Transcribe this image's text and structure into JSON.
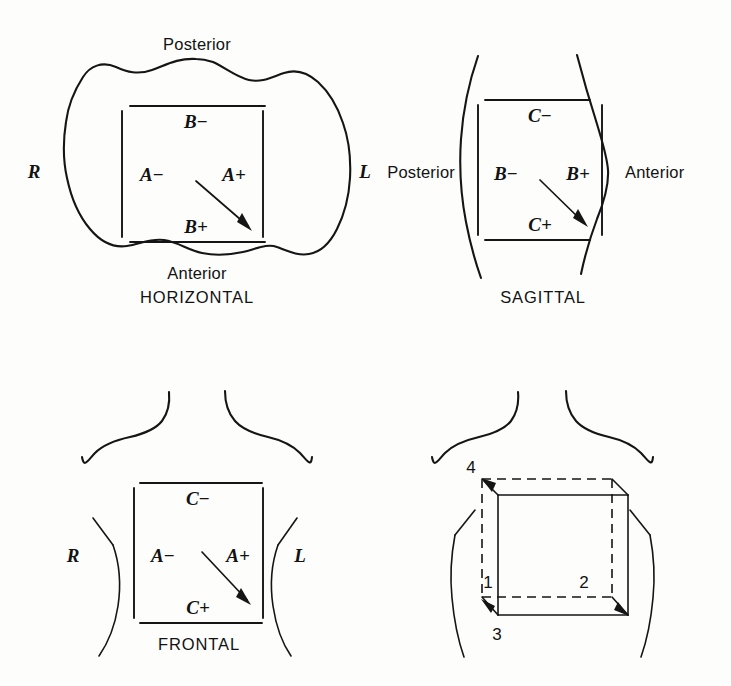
{
  "figure": {
    "background_color": "#fdfdfc",
    "ink_color": "#151515",
    "panels": [
      {
        "id": "horizontal",
        "caption": "HORIZONTAL",
        "orientation_labels": {
          "top": "Posterior",
          "bottom": "Anterior",
          "left": "R",
          "right": "L"
        },
        "axis_labels": {
          "top_inner": "B−",
          "bottom_inner": "B+",
          "left_inner": "A−",
          "right_inner": "A+"
        },
        "arrow": "diagonal-down-right"
      },
      {
        "id": "sagittal",
        "caption": "SAGITTAL",
        "orientation_labels": {
          "left": "Posterior",
          "right": "Anterior"
        },
        "axis_labels": {
          "top_inner": "C−",
          "bottom_inner": "C+",
          "left_inner": "B−",
          "right_inner": "B+"
        },
        "arrow": "diagonal-down-right"
      },
      {
        "id": "frontal",
        "caption": "FRONTAL",
        "orientation_labels": {
          "left": "R",
          "right": "L"
        },
        "axis_labels": {
          "top_inner": "C−",
          "bottom_inner": "C+",
          "left_inner": "A−",
          "right_inner": "A+"
        },
        "arrow": "diagonal-down-right"
      },
      {
        "id": "cube",
        "caption": "",
        "corner_labels": [
          "1",
          "2",
          "3",
          "4"
        ],
        "line_styles": [
          "solid",
          "dashed"
        ]
      }
    ]
  },
  "labels": {
    "posterior": "Posterior",
    "anterior": "Anterior",
    "right": "R",
    "left": "L",
    "horizontal": "HORIZONTAL",
    "sagittal": "SAGITTAL",
    "frontal": "FRONTAL",
    "a_minus": "A−",
    "a_plus": "A+",
    "b_minus": "B−",
    "b_plus": "B+",
    "c_minus": "C−",
    "c_plus": "C+",
    "one": "1",
    "two": "2",
    "three": "3",
    "four": "4"
  }
}
